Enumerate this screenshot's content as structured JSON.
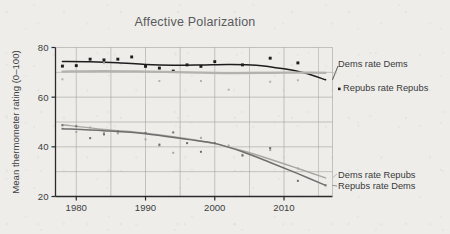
{
  "chart_data": {
    "type": "scatter",
    "title": "Affective Polarization",
    "xlabel": "",
    "ylabel": "Mean thermometer rating (0–100)",
    "xlim": [
      1977,
      1977
    ],
    "ylim": [
      20,
      80
    ],
    "x_ticks": [
      1980,
      1990,
      2000,
      2010
    ],
    "x_tick_labels": [
      "1980",
      "1990",
      "2000",
      "2010"
    ],
    "y_ticks": [
      20,
      40,
      60,
      80
    ],
    "y_tick_labels": [
      "20",
      "40",
      "60",
      "80"
    ],
    "grid": true,
    "grid_x_minor_step": 5,
    "legend_position": "right-inline",
    "x_axis_min": 1977,
    "x_axis_max": 2017,
    "series": [
      {
        "name": "Dems rate Dems",
        "color": "#1d1d1d",
        "marker": "filled-square",
        "line": "smooth",
        "label_x": 2017.5,
        "label_y": 71.5,
        "points": [
          {
            "x": 1978,
            "y": 72.5
          },
          {
            "x": 1980,
            "y": 72.7
          },
          {
            "x": 1982,
            "y": 75.3
          },
          {
            "x": 1984,
            "y": 75.0
          },
          {
            "x": 1986,
            "y": 75.3
          },
          {
            "x": 1988,
            "y": 76.2
          },
          {
            "x": 1990,
            "y": 72.4
          },
          {
            "x": 1992,
            "y": 71.7
          },
          {
            "x": 1994,
            "y": 70.5
          },
          {
            "x": 1996,
            "y": 73.0
          },
          {
            "x": 1998,
            "y": 72.4
          },
          {
            "x": 2000,
            "y": 74.3
          },
          {
            "x": 2004,
            "y": 73.0
          },
          {
            "x": 2008,
            "y": 75.7
          },
          {
            "x": 2012,
            "y": 73.8
          }
        ],
        "fit": [
          {
            "x": 1978,
            "y": 74.4
          },
          {
            "x": 1982,
            "y": 74.3
          },
          {
            "x": 1986,
            "y": 73.9
          },
          {
            "x": 1990,
            "y": 73.2
          },
          {
            "x": 1994,
            "y": 72.9
          },
          {
            "x": 1998,
            "y": 73.0
          },
          {
            "x": 2002,
            "y": 73.2
          },
          {
            "x": 2006,
            "y": 72.9
          },
          {
            "x": 2010,
            "y": 71.4
          },
          {
            "x": 2013,
            "y": 69.7
          },
          {
            "x": 2016,
            "y": 67.0
          }
        ]
      },
      {
        "name": "Repubs rate Repubs",
        "color": "#b3b3ae",
        "marker": "filled-square-small",
        "line": "smooth",
        "label_x": 2017.5,
        "label_y": 64.0,
        "points": [
          {
            "x": 1978,
            "y": 67.2
          },
          {
            "x": 1984,
            "y": 73.7
          },
          {
            "x": 1992,
            "y": 66.5
          },
          {
            "x": 1998,
            "y": 66.5
          },
          {
            "x": 2002,
            "y": 63.0
          },
          {
            "x": 2008,
            "y": 66.2
          },
          {
            "x": 2012,
            "y": 66.8
          }
        ],
        "fit": [
          {
            "x": 1978,
            "y": 70.3
          },
          {
            "x": 1984,
            "y": 70.5
          },
          {
            "x": 1990,
            "y": 70.3
          },
          {
            "x": 1996,
            "y": 70.0
          },
          {
            "x": 2002,
            "y": 69.7
          },
          {
            "x": 2008,
            "y": 69.8
          },
          {
            "x": 2012,
            "y": 69.9
          },
          {
            "x": 2016,
            "y": 69.8
          }
        ]
      },
      {
        "name": "Dems rate Repubs",
        "color": "#a8a8a3",
        "marker": "filled-square-small",
        "line": "smooth",
        "label_x": 2017.5,
        "label_y": 29.5,
        "points": [
          {
            "x": 1978,
            "y": 47.3
          },
          {
            "x": 1980,
            "y": 46.0
          },
          {
            "x": 1982,
            "y": 47.8
          },
          {
            "x": 1984,
            "y": 45.6
          },
          {
            "x": 1986,
            "y": 45.4
          },
          {
            "x": 1990,
            "y": 43.0
          },
          {
            "x": 1992,
            "y": 40.5
          },
          {
            "x": 1994,
            "y": 37.6
          },
          {
            "x": 1998,
            "y": 43.6
          },
          {
            "x": 2002,
            "y": 40.5
          },
          {
            "x": 2004,
            "y": 36.8
          },
          {
            "x": 2008,
            "y": 38.7
          },
          {
            "x": 2012,
            "y": 31.3
          }
        ],
        "fit": [
          {
            "x": 1978,
            "y": 48.9
          },
          {
            "x": 1984,
            "y": 47.0
          },
          {
            "x": 1990,
            "y": 45.5
          },
          {
            "x": 1996,
            "y": 43.3
          },
          {
            "x": 2000,
            "y": 41.3
          },
          {
            "x": 2004,
            "y": 38.4
          },
          {
            "x": 2008,
            "y": 35.0
          },
          {
            "x": 2012,
            "y": 31.3
          },
          {
            "x": 2016,
            "y": 27.5
          }
        ]
      },
      {
        "name": "Repubs rate Dems",
        "color": "#6e6e6e",
        "marker": "filled-square-small",
        "line": "smooth",
        "label_x": 2017.5,
        "label_y": 25.5,
        "points": [
          {
            "x": 1978,
            "y": 48.7
          },
          {
            "x": 1980,
            "y": 48.3
          },
          {
            "x": 1982,
            "y": 43.5
          },
          {
            "x": 1984,
            "y": 45.0
          },
          {
            "x": 1986,
            "y": 46.2
          },
          {
            "x": 1990,
            "y": 45.6
          },
          {
            "x": 1992,
            "y": 40.9
          },
          {
            "x": 1994,
            "y": 45.8
          },
          {
            "x": 1996,
            "y": 41.5
          },
          {
            "x": 1998,
            "y": 38.0
          },
          {
            "x": 2000,
            "y": 41.5
          },
          {
            "x": 2004,
            "y": 36.5
          },
          {
            "x": 2008,
            "y": 39.5
          },
          {
            "x": 2012,
            "y": 26.3
          },
          {
            "x": 2016,
            "y": 24.5
          }
        ],
        "fit": [
          {
            "x": 1978,
            "y": 47.3
          },
          {
            "x": 1984,
            "y": 46.5
          },
          {
            "x": 1990,
            "y": 45.3
          },
          {
            "x": 1996,
            "y": 43.0
          },
          {
            "x": 2000,
            "y": 41.4
          },
          {
            "x": 2004,
            "y": 38.0
          },
          {
            "x": 2008,
            "y": 33.7
          },
          {
            "x": 2012,
            "y": 29.2
          },
          {
            "x": 2016,
            "y": 24.5
          }
        ]
      }
    ]
  },
  "legend": {
    "items": [
      {
        "label": "Dems rate Dems",
        "marker": "none"
      },
      {
        "label": "Repubs rate Repubs",
        "marker": "dot"
      },
      {
        "label": "Dems rate Repubs",
        "marker": "none"
      },
      {
        "label": "Repubs rate Dems",
        "marker": "none"
      }
    ]
  },
  "colors": {
    "background": "#eeedea",
    "grid": "#9a9a9a",
    "axis": "#2b2b2b",
    "title": "#5a5a5c",
    "text": "#3d3d3f"
  }
}
